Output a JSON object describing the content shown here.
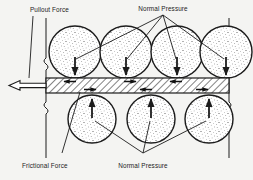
{
  "figure": {
    "type": "engineering-schematic",
    "background_color": "#f4f4f2",
    "line_color": "#1c1c1c",
    "fill_color": "#ffffff",
    "soil_particle_fill": "stipple-speckle"
  },
  "labels": {
    "pullout_force": "Pullout Force",
    "normal_pressure_top": "Normal Pressure",
    "frictional_force": "Frictional Force",
    "normal_pressure_bottom": "Normal Pressure"
  },
  "elements": {
    "reinforcement_strip": {
      "name": "hatched-reinforcement-strip",
      "hatch": "diagonal-45",
      "x": 46,
      "y": 78,
      "width": 183,
      "height": 15
    },
    "pullout_arrow": {
      "name": "pullout-force-arrow",
      "direction": "left",
      "style": "hollow-outline",
      "from_x": 46,
      "to_x": 9,
      "y": 85
    },
    "boundary_lines": {
      "left_x": 46,
      "right_x": 229,
      "top_y": 18,
      "bottom_y": 158,
      "break_symbol": "zigzag"
    },
    "top_particles": [
      {
        "cx": 75,
        "cy": 52,
        "r": 26,
        "arrow": "down"
      },
      {
        "cx": 126,
        "cy": 52,
        "r": 26,
        "arrow": "down"
      },
      {
        "cx": 177,
        "cy": 52,
        "r": 26,
        "arrow": "down"
      },
      {
        "cx": 226,
        "cy": 52,
        "r": 26,
        "arrow": "down"
      }
    ],
    "bottom_particles": [
      {
        "cx": 92,
        "cy": 119,
        "r": 24,
        "arrow": "up"
      },
      {
        "cx": 151,
        "cy": 119,
        "r": 24,
        "arrow": "up"
      },
      {
        "cx": 209,
        "cy": 119,
        "r": 24,
        "arrow": "up"
      }
    ],
    "friction_arrows_in_strip": [
      {
        "x": 68,
        "y": 82,
        "direction": "left"
      },
      {
        "x": 120,
        "y": 82,
        "direction": "right"
      },
      {
        "x": 170,
        "y": 82,
        "direction": "left"
      },
      {
        "x": 90,
        "y": 89,
        "direction": "right"
      },
      {
        "x": 145,
        "y": 89,
        "direction": "left"
      },
      {
        "x": 200,
        "y": 89,
        "direction": "right"
      }
    ],
    "leader_lines": {
      "normal_pressure_top_origin": {
        "x": 163,
        "y": 14
      },
      "normal_pressure_bottom_origin": {
        "x": 143,
        "y": 152
      },
      "frictional_force_origin": {
        "x": 62,
        "y": 152
      },
      "pullout_force_origin": {
        "x": 33,
        "y": 14
      }
    }
  }
}
